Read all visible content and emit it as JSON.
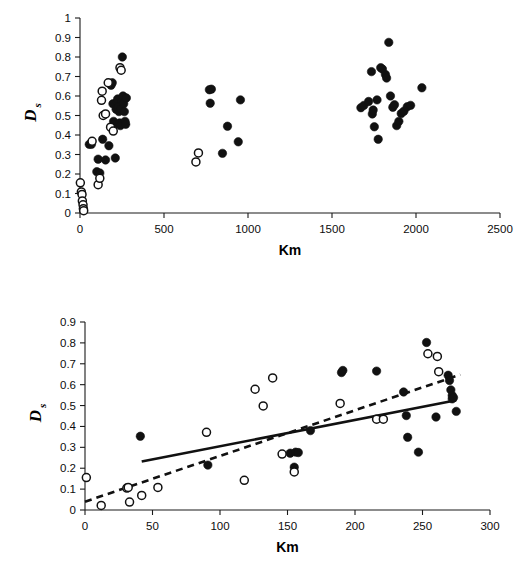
{
  "figure": {
    "title": "",
    "panels": [
      "top",
      "bottom"
    ]
  },
  "chart_data": [
    {
      "id": "top",
      "type": "scatter",
      "title": "",
      "xlabel": "Km",
      "ylabel": "Ds",
      "ylabel_main": "D",
      "ylabel_sub": "s",
      "xlim": [
        0,
        2500
      ],
      "ylim": [
        0,
        1
      ],
      "xticks": [
        0,
        500,
        1000,
        1500,
        2000,
        2500
      ],
      "yticks": [
        0,
        0.1,
        0.2,
        0.3,
        0.4,
        0.5,
        0.6,
        0.7,
        0.8,
        0.9,
        1
      ],
      "xtick_labels": [
        "0",
        "500",
        "1000",
        "1500",
        "2000",
        "2500"
      ],
      "ytick_labels": [
        "0",
        "0.1",
        "0.2",
        "0.3",
        "0.4",
        "0.5",
        "0.6",
        "0.7",
        "0.8",
        "0.9",
        "1"
      ],
      "grid": false,
      "legend": "none",
      "series": [
        {
          "name": "filled",
          "marker": "filled-circle",
          "color": "#111111",
          "points": [
            [
              55,
              0.352
            ],
            [
              68,
              0.352
            ],
            [
              100,
              0.212
            ],
            [
              108,
              0.276
            ],
            [
              118,
              0.205
            ],
            [
              135,
              0.378
            ],
            [
              152,
              0.272
            ],
            [
              172,
              0.345
            ],
            [
              185,
              0.655
            ],
            [
              192,
              0.668
            ],
            [
              196,
              0.56
            ],
            [
              200,
              0.47
            ],
            [
              205,
              0.455
            ],
            [
              210,
              0.282
            ],
            [
              215,
              0.532
            ],
            [
              220,
              0.57
            ],
            [
              224,
              0.585
            ],
            [
              228,
              0.545
            ],
            [
              232,
              0.52
            ],
            [
              236,
              0.462
            ],
            [
              240,
              0.448
            ],
            [
              244,
              0.535
            ],
            [
              248,
              0.575
            ],
            [
              252,
              0.8
            ],
            [
              256,
              0.6
            ],
            [
              260,
              0.56
            ],
            [
              264,
              0.52
            ],
            [
              268,
              0.47
            ],
            [
              272,
              0.455
            ],
            [
              276,
              0.59
            ],
            [
              770,
              0.632
            ],
            [
              782,
              0.635
            ],
            [
              775,
              0.563
            ],
            [
              848,
              0.306
            ],
            [
              878,
              0.445
            ],
            [
              942,
              0.365
            ],
            [
              955,
              0.58
            ],
            [
              1672,
              0.54
            ],
            [
              1690,
              0.552
            ],
            [
              1718,
              0.572
            ],
            [
              1735,
              0.725
            ],
            [
              1740,
              0.508
            ],
            [
              1745,
              0.528
            ],
            [
              1752,
              0.442
            ],
            [
              1768,
              0.58
            ],
            [
              1775,
              0.378
            ],
            [
              1790,
              0.745
            ],
            [
              1800,
              0.738
            ],
            [
              1818,
              0.71
            ],
            [
              1825,
              0.692
            ],
            [
              1838,
              0.875
            ],
            [
              1848,
              0.6
            ],
            [
              1862,
              0.542
            ],
            [
              1872,
              0.555
            ],
            [
              1885,
              0.448
            ],
            [
              1898,
              0.47
            ],
            [
              1912,
              0.51
            ],
            [
              1928,
              0.522
            ],
            [
              1948,
              0.545
            ],
            [
              1968,
              0.552
            ],
            [
              2035,
              0.642
            ]
          ]
        },
        {
          "name": "open",
          "marker": "open-circle",
          "color": "#ffffff",
          "points": [
            [
              2,
              0.155
            ],
            [
              8,
              0.108
            ],
            [
              12,
              0.095
            ],
            [
              14,
              0.062
            ],
            [
              18,
              0.042
            ],
            [
              20,
              0.022
            ],
            [
              22,
              0.012
            ],
            [
              72,
              0.368
            ],
            [
              108,
              0.145
            ],
            [
              118,
              0.178
            ],
            [
              132,
              0.625
            ],
            [
              128,
              0.578
            ],
            [
              138,
              0.5
            ],
            [
              152,
              0.508
            ],
            [
              168,
              0.668
            ],
            [
              182,
              0.44
            ],
            [
              198,
              0.42
            ],
            [
              238,
              0.745
            ],
            [
              245,
              0.732
            ],
            [
              690,
              0.262
            ],
            [
              705,
              0.308
            ]
          ]
        }
      ]
    },
    {
      "id": "bottom",
      "type": "scatter",
      "title": "",
      "xlabel": "Km",
      "ylabel": "Ds",
      "ylabel_main": "D",
      "ylabel_sub": "s",
      "xlim": [
        0,
        300
      ],
      "ylim": [
        0,
        0.9
      ],
      "xticks": [
        0,
        50,
        100,
        150,
        200,
        250,
        300
      ],
      "yticks": [
        0,
        0.1,
        0.2,
        0.3,
        0.4,
        0.5,
        0.6,
        0.7,
        0.8,
        0.9
      ],
      "xtick_labels": [
        "0",
        "50",
        "100",
        "150",
        "200",
        "250",
        "300"
      ],
      "ytick_labels": [
        "0",
        "0.1",
        "0.2",
        "0.3",
        "0.4",
        "0.5",
        "0.6",
        "0.7",
        "0.8",
        "0.9"
      ],
      "grid": false,
      "legend": "none",
      "series": [
        {
          "name": "filled",
          "marker": "filled-circle",
          "color": "#111111",
          "points": [
            [
              41,
              0.353
            ],
            [
              91,
              0.215
            ],
            [
              152,
              0.272
            ],
            [
              156,
              0.277
            ],
            [
              158,
              0.275
            ],
            [
              155,
              0.205
            ],
            [
              167,
              0.38
            ],
            [
              190,
              0.658
            ],
            [
              191,
              0.668
            ],
            [
              216,
              0.665
            ],
            [
              236,
              0.565
            ],
            [
              238,
              0.452
            ],
            [
              239,
              0.348
            ],
            [
              247,
              0.277
            ],
            [
              253,
              0.802
            ],
            [
              260,
              0.445
            ],
            [
              269,
              0.645
            ],
            [
              270,
              0.62
            ],
            [
              271,
              0.575
            ],
            [
              272,
              0.548
            ],
            [
              272,
              0.532
            ],
            [
              273,
              0.538
            ],
            [
              275,
              0.472
            ]
          ]
        },
        {
          "name": "open",
          "marker": "open-circle",
          "color": "#ffffff",
          "points": [
            [
              1,
              0.155
            ],
            [
              12,
              0.022
            ],
            [
              31,
              0.105
            ],
            [
              32,
              0.108
            ],
            [
              33,
              0.038
            ],
            [
              42,
              0.07
            ],
            [
              54,
              0.108
            ],
            [
              90,
              0.372
            ],
            [
              118,
              0.142
            ],
            [
              126,
              0.578
            ],
            [
              132,
              0.498
            ],
            [
              139,
              0.632
            ],
            [
              146,
              0.268
            ],
            [
              155,
              0.182
            ],
            [
              189,
              0.51
            ],
            [
              216,
              0.435
            ],
            [
              221,
              0.435
            ],
            [
              254,
              0.748
            ],
            [
              261,
              0.735
            ],
            [
              262,
              0.662
            ]
          ]
        }
      ],
      "fits": [
        {
          "name": "solid-regression",
          "style": "solid",
          "x": [
            42,
            275
          ],
          "y": [
            0.232,
            0.525
          ]
        },
        {
          "name": "dashed-regression",
          "style": "dashed",
          "x": [
            0,
            278
          ],
          "y": [
            0.04,
            0.648
          ]
        }
      ]
    }
  ]
}
